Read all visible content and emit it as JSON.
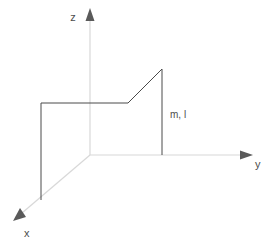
{
  "figure": {
    "background_color": "#ffffff",
    "width": 276,
    "height": 244
  },
  "axes": {
    "origin": {
      "x": 90,
      "y": 155
    },
    "stroke_color": "#d8d8d8",
    "arrow_color": "#5a5a5a",
    "label_color": "#4d4d4d",
    "items": [
      {
        "name": "z",
        "label": "z",
        "label_x": 73,
        "label_y": 21,
        "line": {
          "x1": 90,
          "y1": 155,
          "x2": 90,
          "y2": 18
        },
        "arrow_tip": {
          "x": 90,
          "y": 8
        },
        "direction": "up"
      },
      {
        "name": "y",
        "label": "y",
        "label_x": 255,
        "label_y": 167,
        "line": {
          "x1": 90,
          "y1": 155,
          "x2": 242,
          "y2": 155
        },
        "arrow_tip": {
          "x": 253,
          "y": 155
        },
        "direction": "right"
      },
      {
        "name": "x",
        "label": "x",
        "label_x": 24,
        "label_y": 236,
        "line": {
          "x1": 90,
          "y1": 155,
          "x2": 22,
          "y2": 213
        },
        "arrow_tip": {
          "x": 13,
          "y": 221
        },
        "direction": "down-left"
      }
    ]
  },
  "body_shape": {
    "name": "bent-plate",
    "stroke_color": "#4a4a4a",
    "stroke_width": 1,
    "fill": "none",
    "vertices": [
      {
        "name": "left-top",
        "x": 41,
        "y": 103
      },
      {
        "name": "bend-top",
        "x": 128,
        "y": 103
      },
      {
        "name": "peak",
        "x": 162,
        "y": 69
      },
      {
        "name": "right-base",
        "x": 162,
        "y": 155
      },
      {
        "name": "left-base",
        "x": 41,
        "y": 200
      }
    ],
    "segments": [
      {
        "name": "left-vertical-edge",
        "from": "left-top",
        "to": "left-base",
        "x1": 41,
        "y1": 103,
        "x2": 41,
        "y2": 200
      },
      {
        "name": "top-horizontal-edge",
        "from": "left-top",
        "to": "bend-top",
        "x1": 41,
        "y1": 103,
        "x2": 128,
        "y2": 103
      },
      {
        "name": "diagonal-ramp-edge",
        "from": "bend-top",
        "to": "peak",
        "x1": 128,
        "y1": 103,
        "x2": 162,
        "y2": 69
      },
      {
        "name": "right-vertical-edge",
        "from": "peak",
        "to": "right-base",
        "x1": 162,
        "y1": 69,
        "x2": 162,
        "y2": 155
      }
    ]
  },
  "annotations": [
    {
      "name": "mass-length-label",
      "text": "m, l",
      "x": 170,
      "y": 118,
      "color": "#4d4d4d"
    }
  ]
}
